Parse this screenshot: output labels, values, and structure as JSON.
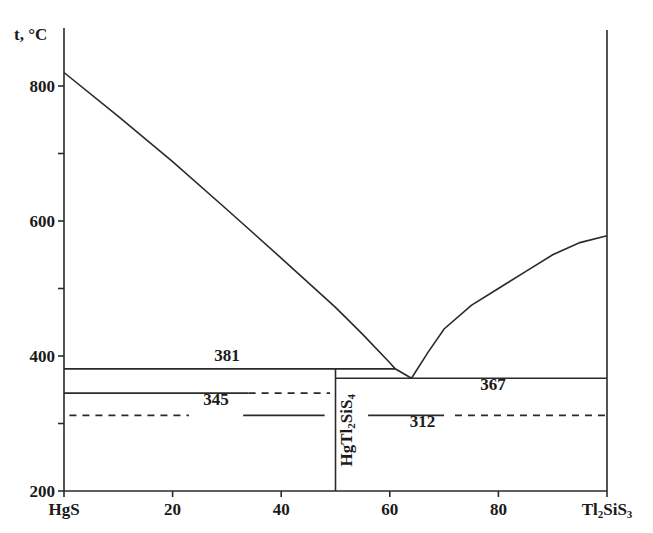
{
  "chart_data": {
    "type": "line",
    "title": "",
    "xlabel": "",
    "ylabel": "t, °C",
    "x_left_label": "HgS",
    "x_right_label": "Tl2SiS3",
    "x_right_label_parts": {
      "a": "Tl",
      "sub1": "2",
      "b": "SiS",
      "sub2": "3"
    },
    "xlim": [
      0,
      100
    ],
    "ylim": [
      200,
      850
    ],
    "x_ticks": [
      0,
      20,
      40,
      60,
      80,
      100
    ],
    "x_tick_labels": [
      "HgS",
      "20",
      "40",
      "60",
      "80",
      "Tl2SiS3"
    ],
    "y_ticks": [
      200,
      300,
      400,
      500,
      600,
      700,
      800
    ],
    "y_tick_labels": [
      "200",
      "",
      "400",
      "",
      "600",
      "",
      "800"
    ],
    "grid": false,
    "legend": null,
    "series": [
      {
        "name": "liquidus HgS side",
        "style": "solid",
        "points": [
          [
            0,
            820
          ],
          [
            10,
            755
          ],
          [
            20,
            688
          ],
          [
            30,
            617
          ],
          [
            40,
            545
          ],
          [
            50,
            472
          ],
          [
            55,
            432
          ],
          [
            60,
            390
          ],
          [
            61,
            381
          ],
          [
            64,
            367
          ]
        ]
      },
      {
        "name": "liquidus Tl2SiS3 side",
        "style": "solid",
        "points": [
          [
            64,
            367
          ],
          [
            67,
            405
          ],
          [
            70,
            440
          ],
          [
            75,
            475
          ],
          [
            80,
            500
          ],
          [
            85,
            525
          ],
          [
            90,
            550
          ],
          [
            95,
            568
          ],
          [
            100,
            578
          ]
        ]
      },
      {
        "name": "peritectic line 381",
        "style": "solid",
        "points": [
          [
            0,
            381
          ],
          [
            61,
            381
          ]
        ]
      },
      {
        "name": "eutectic line 367",
        "style": "solid",
        "points": [
          [
            50,
            367
          ],
          [
            100,
            367
          ]
        ]
      },
      {
        "name": "line 345 (solid part)",
        "style": "solid",
        "points": [
          [
            0,
            345
          ],
          [
            34,
            345
          ]
        ]
      },
      {
        "name": "line 345 (dashed part)",
        "style": "dashed",
        "points": [
          [
            34,
            345
          ],
          [
            49,
            345
          ]
        ]
      },
      {
        "name": "line 312 (dashed left)",
        "style": "dashed",
        "points": [
          [
            1,
            312
          ],
          [
            23,
            312
          ]
        ]
      },
      {
        "name": "line 312 (solid middle)",
        "style": "solid",
        "points": [
          [
            33,
            312
          ],
          [
            48,
            312
          ]
        ]
      },
      {
        "name": "line 312 (solid right)",
        "style": "solid",
        "points": [
          [
            56,
            312
          ],
          [
            70,
            312
          ]
        ]
      },
      {
        "name": "line 312 (dashed right)",
        "style": "dashed",
        "points": [
          [
            72,
            312
          ],
          [
            100,
            312
          ]
        ]
      },
      {
        "name": "HgTl2SiS4 compound line",
        "style": "solid",
        "points": [
          [
            50,
            200
          ],
          [
            50,
            381
          ]
        ]
      }
    ],
    "annotations": [
      {
        "text": "381",
        "x": 30,
        "y": 392
      },
      {
        "text": "367",
        "x": 79,
        "y": 350
      },
      {
        "text": "345",
        "x": 28,
        "y": 327
      },
      {
        "text": "312",
        "x": 66,
        "y": 295
      },
      {
        "text": "HgTl2SiS4",
        "x": 53,
        "y": 290,
        "rotation": -90,
        "parts": {
          "a": "HgTl",
          "sub1": "2",
          "b": "SiS",
          "sub2": "4"
        }
      }
    ]
  }
}
